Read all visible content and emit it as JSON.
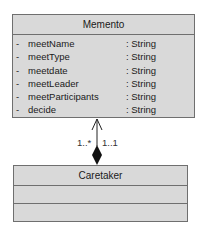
{
  "memento": {
    "name": "Memento",
    "attributes": [
      {
        "visibility": "-",
        "name": "meetName",
        "type": ": String"
      },
      {
        "visibility": "-",
        "name": "meetType",
        "type": ": String"
      },
      {
        "visibility": "-",
        "name": "meetdate",
        "type": ": String"
      },
      {
        "visibility": "-",
        "name": "meetLeader",
        "type": ": String"
      },
      {
        "visibility": "-",
        "name": "meetParticipants",
        "type": ": String"
      },
      {
        "visibility": "-",
        "name": "decide",
        "type": ": String"
      }
    ]
  },
  "caretaker": {
    "name": "Caretaker"
  },
  "association": {
    "type": "composition",
    "multiplicity_memento_side": "1..*",
    "multiplicity_caretaker_side": "1..1",
    "colors": {
      "line": "#222222",
      "box_fill": "#d9d9d9",
      "box_border": "#6f6f6f"
    }
  }
}
